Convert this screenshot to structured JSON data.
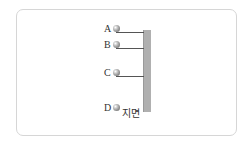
{
  "diagram": {
    "ground_label": "지면",
    "pole": {
      "color": "#b0b0b0"
    },
    "balls": [
      {
        "label": "A",
        "y": 28,
        "rod": true
      },
      {
        "label": "B",
        "y": 44,
        "rod": true
      },
      {
        "label": "C",
        "y": 72,
        "rod": true
      },
      {
        "label": "D",
        "y": 106,
        "rod": false
      }
    ]
  }
}
